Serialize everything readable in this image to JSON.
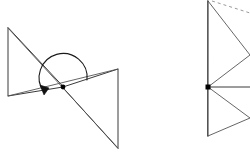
{
  "figure": {
    "background_color": "#ffffff",
    "stroke_color": "#3a3a3a",
    "accent_color": "#000000",
    "dashed_color": "#9a9a9a",
    "width": 250,
    "height": 159
  },
  "left_diagram": {
    "name": "pre-image and image triangles with rotation arc",
    "center_point": {
      "x": 63,
      "y": 87,
      "label": ""
    },
    "triangle_preimage": {
      "points": "8,28 8,96 63,87",
      "vertices": [
        {
          "x": 8,
          "y": 28
        },
        {
          "x": 8,
          "y": 96
        },
        {
          "x": 63,
          "y": 87
        }
      ]
    },
    "triangle_image": {
      "points": "63,87 118,69 118,148",
      "vertices": [
        {
          "x": 63,
          "y": 87
        },
        {
          "x": 118,
          "y": 69
        },
        {
          "x": 118,
          "y": 148
        }
      ]
    },
    "transversal_line": {
      "x1": 8,
      "y1": 28,
      "x2": 118,
      "y2": 148
    },
    "baseline_line": {
      "x1": 8,
      "y1": 96,
      "x2": 118,
      "y2": 69
    },
    "rotation_arc": {
      "path": "M 44,92 A 24 24 0 1 1 87,80",
      "sweep_degrees": 180,
      "direction": "counterclockwise"
    },
    "arrow_head": {
      "points": "44,95 40,85 49,88",
      "tip": {
        "x": 44,
        "y": 95
      }
    }
  },
  "right_diagram": {
    "name": "partially cropped triangles with dashed segment",
    "center_point": {
      "x": 208,
      "y": 87,
      "label": ""
    },
    "vertical_axis": {
      "x1": 208,
      "y1": 1,
      "x2": 208,
      "y2": 136
    },
    "horizontal_ray": {
      "x1": 208,
      "y1": 87,
      "x2": 250,
      "y2": 87
    },
    "upper_triangle": {
      "points": "208,1 250,55 208,87",
      "vertices": [
        {
          "x": 208,
          "y": 1
        },
        {
          "x": 250,
          "y": 55
        },
        {
          "x": 208,
          "y": 87
        }
      ]
    },
    "lower_triangle": {
      "points": "208,87 250,118 208,136",
      "vertices": [
        {
          "x": 208,
          "y": 87
        },
        {
          "x": 250,
          "y": 118
        },
        {
          "x": 208,
          "y": 136
        }
      ]
    },
    "dashed_segment": {
      "x1": 212,
      "y1": 1,
      "x2": 250,
      "y2": 13
    }
  }
}
